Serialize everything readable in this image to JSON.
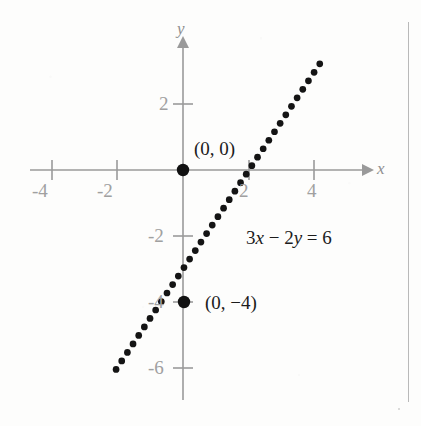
{
  "figure": {
    "kind": "cartesian-graph",
    "width": 421,
    "height": 426,
    "background_color": "#fdfdfc",
    "axis_color": "#9a9a9a",
    "ink_color": "#141414",
    "page_rule_color": "#b9b9b9"
  },
  "axes": {
    "x_axis_label": "x",
    "y_axis_label": "y",
    "x_tick_labels": [
      "-4",
      "-2",
      "2",
      "4"
    ],
    "y_tick_labels": [
      "2",
      "-2",
      "-4",
      "-6"
    ]
  },
  "annotations": {
    "origin_point_label": "(0, 0)",
    "y_intercept_point_label": "(0, −4)",
    "equation_prefix": "3",
    "equation_x": "x",
    "equation_minus": " − ",
    "equation_coefficient": "2",
    "equation_y": "y",
    "equation_equals": " = ",
    "equation_rhs": "6",
    "equation_full": "3x − 2y = 6"
  },
  "chart_data": {
    "type": "line",
    "title": "",
    "xlabel": "x",
    "ylabel": "y",
    "xlim": [
      -5.2,
      5.8
    ],
    "ylim": [
      -7.2,
      3.9
    ],
    "grid": false,
    "legend": "none",
    "x_ticks": [
      -4,
      -2,
      2,
      4
    ],
    "y_ticks": [
      2,
      -2,
      -4,
      -6
    ],
    "series": [
      {
        "name": "3x - 2y = 6",
        "style": "dotted",
        "slope": 1.5,
        "y_intercept": -3,
        "x_intercept": 2,
        "x_range": [
          -4.6,
          4.22
        ],
        "x": [
          -4.6,
          -4.0,
          -3.0,
          -2.0,
          -1.0,
          0.0,
          1.0,
          2.0,
          3.0,
          4.0,
          4.22
        ],
        "y": [
          -9.9,
          -9.0,
          -7.5,
          -6.0,
          -4.5,
          -3.0,
          -1.5,
          0.0,
          1.5,
          3.0,
          3.33
        ],
        "annotation": "3x − 2y = 6"
      }
    ],
    "marked_points": [
      {
        "label": "(0, 0)",
        "x": 0,
        "y": 0
      },
      {
        "label": "(0, -4)",
        "x": 0,
        "y": -4
      }
    ]
  }
}
